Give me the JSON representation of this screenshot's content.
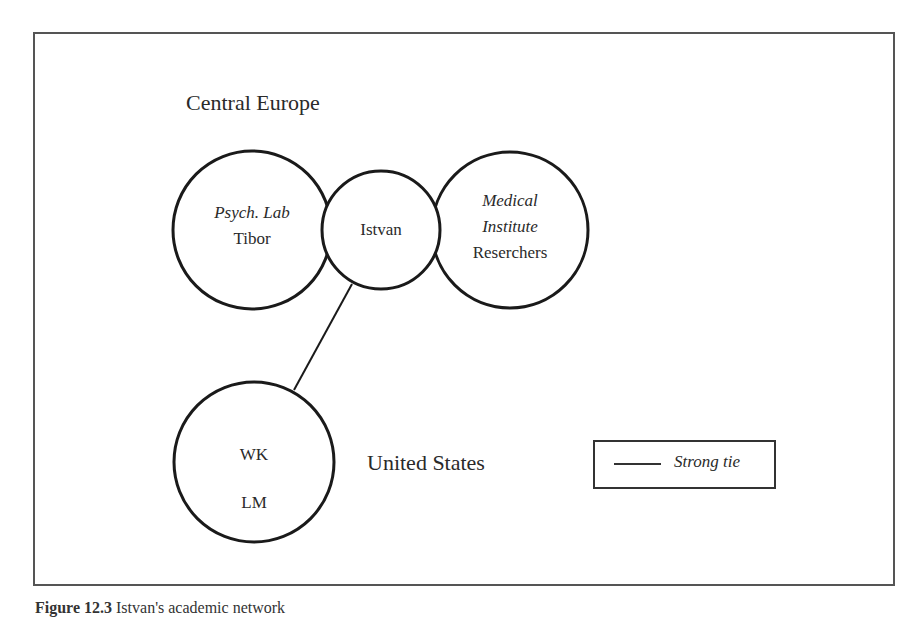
{
  "figure": {
    "caption_number": "Figure 12.3",
    "caption_text": "Istvan's academic network"
  },
  "regions": {
    "central_europe": "Central Europe",
    "united_states": "United States"
  },
  "nodes": [
    {
      "id": "psych-lab",
      "line1": "Psych. Lab",
      "line1_style": "italic",
      "line2": "Tibor",
      "cx": 252,
      "cy": 230,
      "r": 80
    },
    {
      "id": "istvan",
      "label": "Istvan",
      "cx": 381,
      "cy": 230,
      "r": 59
    },
    {
      "id": "medical-institute",
      "line1": "Medical",
      "line2": "Institute",
      "line1_2_style": "italic",
      "line3": "Reserchers",
      "cx": 510,
      "cy": 230,
      "r": 79
    },
    {
      "id": "us-group",
      "line1": "WK",
      "line2": "LM",
      "cx": 254,
      "cy": 462,
      "r": 81
    }
  ],
  "edges": [
    {
      "from": "istvan",
      "to": "us-group",
      "type": "strong-tie"
    }
  ],
  "legend": {
    "items": [
      {
        "symbol": "solid-line",
        "label": "Strong tie"
      }
    ]
  },
  "colors": {
    "stroke": "#1a1a1a",
    "text": "#2a2a2a",
    "frame": "#555555"
  }
}
